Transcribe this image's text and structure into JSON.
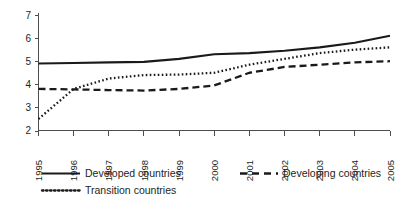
{
  "chart_data": {
    "type": "line",
    "title": "",
    "subtitle": "",
    "xlabel": "",
    "ylabel": "",
    "x": [
      1995,
      1996,
      1997,
      1998,
      1999,
      2000,
      2001,
      2002,
      2003,
      2004,
      2005
    ],
    "categories": [
      "1995",
      "1996",
      "1997",
      "1998",
      "1999",
      "2000",
      "2001",
      "2002",
      "2003",
      "2004",
      "2005"
    ],
    "xlim": [
      1995,
      2005
    ],
    "ylim": [
      2,
      7
    ],
    "yticks": [
      2,
      3,
      4,
      5,
      6,
      7
    ],
    "ytick_labels": [
      "2",
      "3",
      "4",
      "5",
      "6",
      "7"
    ],
    "grid": false,
    "legend_position": "bottom-left",
    "series": [
      {
        "name": "Developed countries",
        "style": "solid",
        "color": "#1a1a1a",
        "values": [
          4.9,
          4.92,
          4.95,
          4.97,
          5.1,
          5.3,
          5.35,
          5.45,
          5.6,
          5.8,
          6.1
        ]
      },
      {
        "name": "Developing countries",
        "style": "dashed",
        "color": "#1a1a1a",
        "values": [
          3.8,
          3.78,
          3.75,
          3.73,
          3.8,
          3.95,
          4.5,
          4.75,
          4.85,
          4.95,
          5.0
        ]
      },
      {
        "name": "Transition countries",
        "style": "dotted",
        "color": "#1a1a1a",
        "values": [
          2.5,
          3.8,
          4.25,
          4.4,
          4.42,
          4.5,
          4.85,
          5.1,
          5.35,
          5.5,
          5.6
        ]
      }
    ]
  },
  "legend": {
    "items": [
      {
        "label": "Developed countries",
        "style": "solid"
      },
      {
        "label": "Developing countries",
        "style": "dashed"
      },
      {
        "label": "Transition countries",
        "style": "dotted"
      }
    ]
  },
  "axis": {
    "y_tick_labels": [
      "7",
      "6",
      "5",
      "4",
      "3",
      "2"
    ],
    "x_tick_labels": [
      "1995",
      "1996",
      "1997",
      "1998",
      "1999",
      "2000",
      "2001",
      "2002",
      "2003",
      "2004",
      "2005"
    ]
  }
}
